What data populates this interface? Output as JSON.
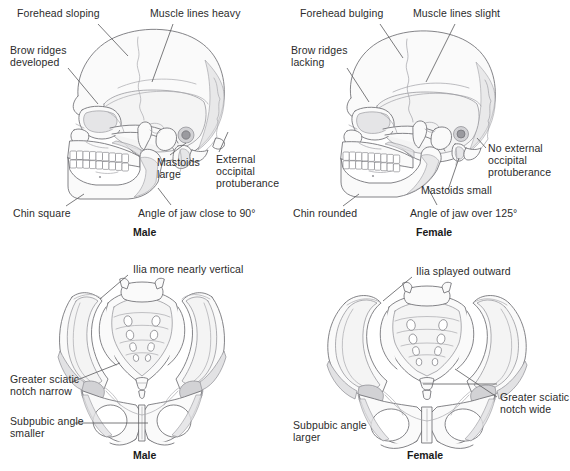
{
  "panels": [
    {
      "id": "male-skull",
      "caption": "Male",
      "subject": "skull",
      "sex": "Male",
      "labels": [
        {
          "key": "forehead",
          "text": "Forehead sloping"
        },
        {
          "key": "muscle_lines",
          "text": "Muscle lines heavy"
        },
        {
          "key": "brow_ridges",
          "text": "Brow ridges\ndeveloped"
        },
        {
          "key": "external_occipital",
          "text": "External\noccipital\nprotuberance"
        },
        {
          "key": "mastoids",
          "text": "Mastoids\nlarge"
        },
        {
          "key": "chin",
          "text": "Chin square"
        },
        {
          "key": "jaw_angle",
          "text": "Angle of jaw close to 90°"
        }
      ]
    },
    {
      "id": "female-skull",
      "caption": "Female",
      "subject": "skull",
      "sex": "Female",
      "labels": [
        {
          "key": "forehead",
          "text": "Forehead bulging"
        },
        {
          "key": "muscle_lines",
          "text": "Muscle lines slight"
        },
        {
          "key": "brow_ridges",
          "text": "Brow ridges\nlacking"
        },
        {
          "key": "external_occipital",
          "text": "No external\noccipital\nprotuberance"
        },
        {
          "key": "mastoids",
          "text": "Mastoids small"
        },
        {
          "key": "chin",
          "text": "Chin rounded"
        },
        {
          "key": "jaw_angle",
          "text": "Angle of jaw over 125°"
        }
      ]
    },
    {
      "id": "male-pelvis",
      "caption": "Male",
      "subject": "pelvis",
      "sex": "Male",
      "labels": [
        {
          "key": "ilia",
          "text": "Ilia more nearly vertical"
        },
        {
          "key": "sciatic_notch",
          "text": "Greater sciatic\nnotch narrow"
        },
        {
          "key": "subpubic_angle",
          "text": "Subpubic angle\nsmaller"
        }
      ]
    },
    {
      "id": "female-pelvis",
      "caption": "Female",
      "subject": "pelvis",
      "sex": "Female",
      "labels": [
        {
          "key": "ilia",
          "text": "Ilia splayed outward"
        },
        {
          "key": "sciatic_notch",
          "text": "Greater sciatic\nnotch wide"
        },
        {
          "key": "subpubic_angle",
          "text": "Subpubic angle\nlarger"
        }
      ]
    }
  ],
  "colors": {
    "bone_fill": "#fafafa",
    "bone_outline": "#6e6e72",
    "shade": "#e2e2e4",
    "shade_dark": "#d2d2d5",
    "suture": "#a9a9ae",
    "leader": "#59595c",
    "text": "#2b2b2b"
  }
}
